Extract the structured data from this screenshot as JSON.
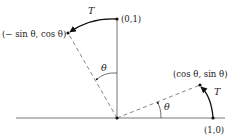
{
  "diagram": {
    "labels": {
      "point_e2": "(0,1)",
      "point_e1": "(1,0)",
      "point_rot_e1": "(cos θ, sin θ)",
      "point_rot_e2": "(− sin θ, cos θ)",
      "transform_top": "T",
      "transform_right": "T",
      "angle_top": "θ",
      "angle_bottom": "θ"
    },
    "colors": {
      "axis": "#555555",
      "dashed": "#777777",
      "arc": "#111111",
      "text": "#222222"
    }
  }
}
